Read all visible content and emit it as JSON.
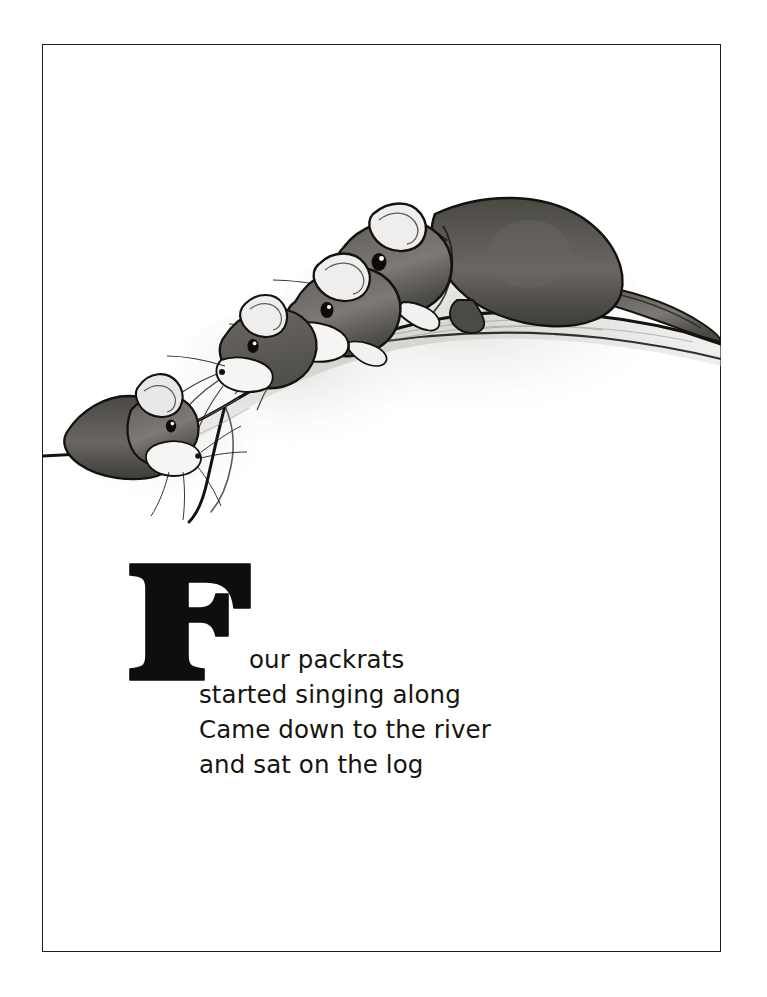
{
  "page": {
    "background_color": "#ffffff",
    "border_color": "#211f1e"
  },
  "illustration": {
    "name": "packrats-on-a-log",
    "description": "Graphite pencil drawing of four packrats of increasing size lined up along a curved log",
    "medium": "pencil",
    "ink_color": "#1a1a1a",
    "fur_color": "#5d5a55",
    "subjects": [
      {
        "label": "packrat-smallest",
        "order": 1
      },
      {
        "label": "packrat-small",
        "order": 2
      },
      {
        "label": "packrat-medium",
        "order": 3
      },
      {
        "label": "packrat-largest",
        "order": 4
      }
    ],
    "prop": "log"
  },
  "verse": {
    "dropcap": "F",
    "lines": [
      "our packrats",
      "started singing along",
      "Came down to the river",
      "and sat on the log"
    ],
    "full_text": "Four packrats\nstarted singing along\nCame down to the river\nand sat on the log",
    "text_color": "#17150f"
  }
}
